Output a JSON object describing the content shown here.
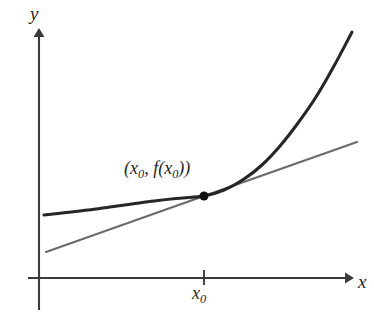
{
  "figure": {
    "background_color": "#ffffff",
    "width": 374,
    "height": 318
  },
  "axes": {
    "x_axis": {
      "label": "x",
      "color": "#3a3a3a",
      "y_pixel": 278,
      "start_x": 28,
      "end_x": 352,
      "arrow": "right-arrow-icon"
    },
    "y_axis": {
      "label": "y",
      "color": "#3a3a3a",
      "x_pixel": 39,
      "start_y": 310,
      "end_y": 30,
      "arrow": "up-arrow-icon"
    },
    "ticks": [
      {
        "label": "x",
        "subscript": "0",
        "axis": "x",
        "x_pixel": 204
      }
    ]
  },
  "annotations": {
    "tangency_label": {
      "open_paren": "(",
      "x_symbol": "x",
      "x_subscript": "0",
      "comma": ", ",
      "f_symbol": "f",
      "inner_open_paren": "(",
      "inner_x_symbol": "x",
      "inner_x_subscript": "0",
      "inner_close_paren": ")",
      "close_paren": ")",
      "full_text": "(x0, f(x0))"
    },
    "tangency_point": {
      "name": "point-of-tangency",
      "x_pixel": 204,
      "y_pixel": 196,
      "radius": 4.5,
      "color": "#111111"
    }
  },
  "chart_data": {
    "type": "line",
    "xlabel": "x",
    "ylabel": "y",
    "grid": false,
    "legend": "none",
    "axis_origin_pixel": [
      39,
      278
    ],
    "series": [
      {
        "name": "function-curve",
        "role": "function f(x)",
        "color": "#262626",
        "stroke_width": 3.1,
        "points_pixel": [
          [
            44,
            215
          ],
          [
            66,
            212.5
          ],
          [
            88,
            210
          ],
          [
            110,
            207
          ],
          [
            132,
            204
          ],
          [
            154,
            201
          ],
          [
            176,
            198.5
          ],
          [
            204,
            196
          ],
          [
            224,
            190
          ],
          [
            244,
            179
          ],
          [
            262,
            165
          ],
          [
            280,
            146
          ],
          [
            298,
            123
          ],
          [
            316,
            97
          ],
          [
            334,
            66
          ],
          [
            352,
            32
          ]
        ]
      },
      {
        "name": "tangent-line",
        "role": "tangent at (x0, f(x0))",
        "color": "#6b6b6b",
        "stroke_width": 2.2,
        "points_pixel": [
          [
            46,
            252
          ],
          [
            204,
            196
          ],
          [
            357,
            142
          ]
        ]
      }
    ]
  }
}
